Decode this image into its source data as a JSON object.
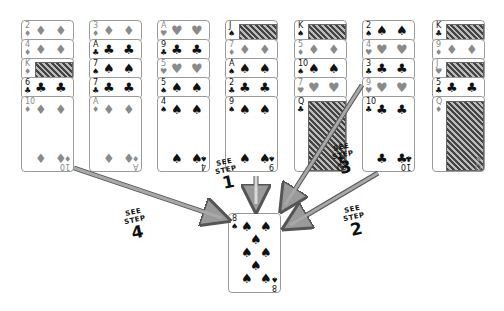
{
  "columns": [
    {
      "x": 21,
      "cards": [
        {
          "rank": "2",
          "suit": "♦",
          "color": "red"
        },
        {
          "rank": "4",
          "suit": "♦",
          "color": "red"
        },
        {
          "rank": "K",
          "suit": "♦",
          "color": "red",
          "face": true
        },
        {
          "rank": "6",
          "suit": "♣",
          "color": "black"
        },
        {
          "rank": "10",
          "suit": "♦",
          "color": "red"
        }
      ]
    },
    {
      "x": 89,
      "cards": [
        {
          "rank": "3",
          "suit": "♦",
          "color": "red"
        },
        {
          "rank": "A",
          "suit": "♣",
          "color": "black"
        },
        {
          "rank": "7",
          "suit": "♠",
          "color": "black"
        },
        {
          "rank": "7",
          "suit": "♣",
          "color": "black"
        },
        {
          "rank": "A",
          "suit": "♦",
          "color": "red"
        }
      ]
    },
    {
      "x": 157,
      "cards": [
        {
          "rank": "A",
          "suit": "♥",
          "color": "red"
        },
        {
          "rank": "9",
          "suit": "♣",
          "color": "black"
        },
        {
          "rank": "5",
          "suit": "♥",
          "color": "red"
        },
        {
          "rank": "5",
          "suit": "♠",
          "color": "black"
        },
        {
          "rank": "4",
          "suit": "♠",
          "color": "black"
        }
      ]
    },
    {
      "x": 225,
      "cards": [
        {
          "rank": "J",
          "suit": "♠",
          "color": "black",
          "face": true
        },
        {
          "rank": "7",
          "suit": "♦",
          "color": "red"
        },
        {
          "rank": "A",
          "suit": "♠",
          "color": "black"
        },
        {
          "rank": "2",
          "suit": "♣",
          "color": "black"
        },
        {
          "rank": "9",
          "suit": "♠",
          "color": "black"
        }
      ]
    },
    {
      "x": 294,
      "cards": [
        {
          "rank": "K",
          "suit": "♠",
          "color": "black",
          "face": true
        },
        {
          "rank": "5",
          "suit": "♦",
          "color": "red"
        },
        {
          "rank": "10",
          "suit": "♠",
          "color": "black"
        },
        {
          "rank": "7",
          "suit": "♥",
          "color": "red"
        },
        {
          "rank": "Q",
          "suit": "♣",
          "color": "black",
          "face": true
        }
      ]
    },
    {
      "x": 362,
      "cards": [
        {
          "rank": "2",
          "suit": "♠",
          "color": "black"
        },
        {
          "rank": "4",
          "suit": "♥",
          "color": "red"
        },
        {
          "rank": "3",
          "suit": "♣",
          "color": "black"
        },
        {
          "rank": "9",
          "suit": "♥",
          "color": "red"
        },
        {
          "rank": "10",
          "suit": "♣",
          "color": "black"
        }
      ]
    },
    {
      "x": 432,
      "cards": [
        {
          "rank": "K",
          "suit": "♣",
          "color": "black",
          "face": true
        },
        {
          "rank": "9",
          "suit": "♦",
          "color": "red"
        },
        {
          "rank": "J",
          "suit": "♥",
          "color": "red",
          "face": true
        },
        {
          "rank": "5",
          "suit": "♣",
          "color": "black"
        },
        {
          "rank": "Q",
          "suit": "♦",
          "color": "red",
          "face": true
        }
      ]
    }
  ],
  "target_card": {
    "rank": "8",
    "suit": "♠",
    "color": "black"
  },
  "step_labels": [
    {
      "line1": "SEE",
      "line2": "STEP",
      "num": "1"
    },
    {
      "line1": "SEE",
      "line2": "STEP",
      "num": "2"
    },
    {
      "line1": "SEE",
      "line2": "STEP",
      "num": "3"
    },
    {
      "line1": "SEE",
      "line2": "STEP",
      "num": "4"
    }
  ],
  "colors": {
    "red_suit": "#8a8a8a",
    "black_suit": "#111111",
    "arrow_fill": "#9a9a9a",
    "arrow_edge": "#555555"
  }
}
